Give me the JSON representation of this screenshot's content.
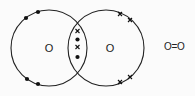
{
  "diagram": {
    "atoms": [
      {
        "symbol": "O",
        "electron_marker": "dot"
      },
      {
        "symbol": "O",
        "electron_marker": "cross"
      }
    ],
    "shared_pair_markers": [
      "cross",
      "dot",
      "cross",
      "dot"
    ],
    "lone_pairs": {
      "left_atom": [
        "dot-pair-top",
        "dot-pair-bottom"
      ],
      "right_atom": [
        "cross-pair-top",
        "cross-pair-bottom"
      ]
    },
    "structural_formula": "O=O",
    "colors": {
      "line": "#222222",
      "background": "#fbfbfb"
    }
  }
}
